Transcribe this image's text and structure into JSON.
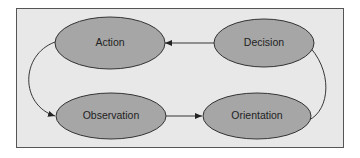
{
  "diagram": {
    "nodes": [
      {
        "id": "action",
        "label": "Action"
      },
      {
        "id": "decision",
        "label": "Decision"
      },
      {
        "id": "observation",
        "label": "Observation"
      },
      {
        "id": "orientation",
        "label": "Orientation"
      }
    ],
    "edges": [
      {
        "from": "observation",
        "to": "orientation"
      },
      {
        "from": "orientation",
        "to": "decision"
      },
      {
        "from": "decision",
        "to": "action"
      },
      {
        "from": "action",
        "to": "observation"
      }
    ],
    "colors": {
      "background": "#e8e8e8",
      "node_fill": "#a6a6a6",
      "stroke": "#333333"
    }
  }
}
